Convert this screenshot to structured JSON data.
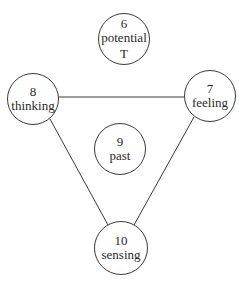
{
  "nodes": [
    {
      "id": "n6",
      "number": "6",
      "label": "potential",
      "extra": "T",
      "cx": 124,
      "cy": 39,
      "r": 26
    },
    {
      "id": "n8",
      "number": "8",
      "label": "thinking",
      "cx": 33,
      "cy": 99,
      "r": 26
    },
    {
      "id": "n7",
      "number": "7",
      "label": "feeling",
      "cx": 210,
      "cy": 96,
      "r": 26
    },
    {
      "id": "n9",
      "number": "9",
      "label": "past",
      "cx": 120,
      "cy": 149,
      "r": 26
    },
    {
      "id": "n10",
      "number": "10",
      "label": "sensing",
      "cx": 121,
      "cy": 248,
      "r": 27
    }
  ],
  "edges": [
    {
      "from": "8",
      "to": "7"
    },
    {
      "from": "8",
      "to": "10"
    },
    {
      "from": "7",
      "to": "10"
    }
  ]
}
